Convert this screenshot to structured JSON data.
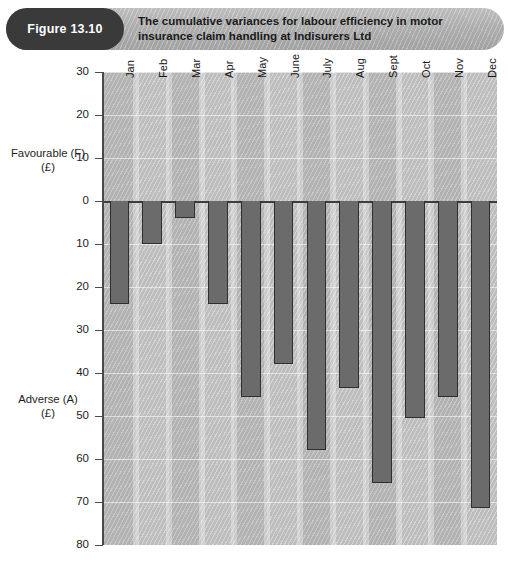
{
  "header": {
    "figure_label": "Figure 13.10",
    "title_line1": "The cumulative variances for labour efficiency in motor",
    "title_line2": "insurance claim handling at Indisurers Ltd",
    "pill_color": "#3a3a3a",
    "banner_color": "#b3b3b3"
  },
  "axis": {
    "favourable_caption_line1": "Favourable (F)",
    "favourable_caption_line2": "(£)",
    "adverse_caption_line1": "Adverse (A)",
    "adverse_caption_line2": "(£)",
    "ticks": [
      "30",
      "20",
      "10",
      "0",
      "10",
      "20",
      "30",
      "40",
      "50",
      "60",
      "70",
      "80"
    ]
  },
  "chart_data": {
    "type": "bar",
    "title": "The cumulative variances for labour efficiency in motor insurance claim handling at Indisurers Ltd",
    "xlabel": "",
    "ylabel": "Favourable (F) (£) / Adverse (A) (£)",
    "categories": [
      "Jan",
      "Feb",
      "Mar",
      "Apr",
      "May",
      "June",
      "July",
      "Aug",
      "Sept",
      "Oct",
      "Nov",
      "Dec"
    ],
    "values": [
      -24,
      -10,
      -4,
      -24,
      -45.5,
      -38,
      -58,
      -43.5,
      -65.5,
      -50.5,
      -45.5,
      -71.5
    ],
    "value_note": "Negative values are Adverse (A), plotted downward from zero; positive would be Favourable (F).",
    "ylim": [
      -80,
      30
    ],
    "ytick_values": [
      30,
      20,
      10,
      0,
      -10,
      -20,
      -30,
      -40,
      -50,
      -60,
      -70,
      -80
    ],
    "ytick_labels": [
      "30",
      "20",
      "10",
      "0",
      "10",
      "20",
      "30",
      "40",
      "50",
      "60",
      "70",
      "80"
    ],
    "grid": true,
    "legend": "none",
    "bar_color": "#6b6b6b",
    "plot_background": "#c3c3c3"
  }
}
